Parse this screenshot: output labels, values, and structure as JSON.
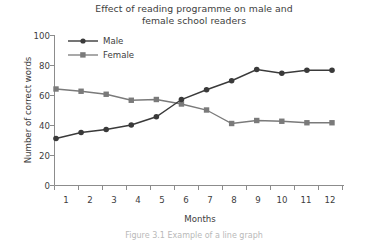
{
  "figure": {
    "title_line_1": "Effect of reading programme on male and",
    "title_line_2": "female school readers",
    "caption": "Figure 3.1 Example of a line graph"
  },
  "chart_data": {
    "type": "line",
    "title": "Effect of reading programme on male and female school readers",
    "xlabel": "Months",
    "ylabel": "Number of correct words",
    "categories": [
      "1",
      "2",
      "3",
      "4",
      "5",
      "6",
      "7",
      "8",
      "9",
      "10",
      "11",
      "12"
    ],
    "x": [
      1,
      2,
      3,
      4,
      5,
      6,
      7,
      8,
      9,
      10,
      11,
      12
    ],
    "xlim": [
      1,
      12
    ],
    "ylim": [
      0,
      100
    ],
    "yticks": [
      0,
      20,
      40,
      60,
      80,
      100
    ],
    "ytick_labels": [
      "0",
      "20",
      "40",
      "60",
      "80",
      "100"
    ],
    "grid": false,
    "legend_position": "upper left",
    "series": [
      {
        "name": "Male",
        "marker": "circle",
        "color": "#3a3a3a",
        "values": [
          31,
          35,
          37,
          40,
          45.5,
          57,
          63.5,
          69.5,
          77,
          74.5,
          76.5,
          76.5
        ]
      },
      {
        "name": "Female",
        "marker": "square",
        "color": "#7a7a7a",
        "values": [
          64,
          62.5,
          60.5,
          56.5,
          57,
          54,
          50,
          41,
          43,
          42.5,
          41.5,
          41.5
        ]
      }
    ]
  },
  "legend": {
    "items": [
      {
        "label": "Male",
        "marker": "circle",
        "color": "#3a3a3a"
      },
      {
        "label": "Female",
        "marker": "square",
        "color": "#7a7a7a"
      }
    ]
  },
  "colors": {
    "male": "#3a3a3a",
    "female": "#7a7a7a",
    "axis": "#8c8c8c",
    "text": "#3d3d3d",
    "background": "#ffffff"
  }
}
